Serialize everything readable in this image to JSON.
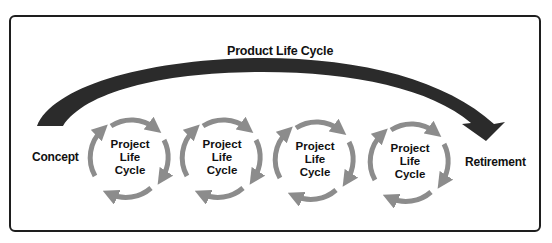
{
  "diagram": {
    "title": "Product Life Cycle",
    "start_label": "Concept",
    "end_label": "Retirement",
    "colors": {
      "frame": "#1e1e1e",
      "product_arrow": "#2b2b2b",
      "cycle_arrows": "#8c8c8c",
      "text": "#111111"
    },
    "cycles": [
      {
        "line1": "Project",
        "line2": "Life",
        "line3": "Cycle"
      },
      {
        "line1": "Project",
        "line2": "Life",
        "line3": "Cycle"
      },
      {
        "line1": "Project",
        "line2": "Life",
        "line3": "Cycle"
      },
      {
        "line1": "Project",
        "line2": "Life",
        "line3": "Cycle"
      }
    ]
  }
}
